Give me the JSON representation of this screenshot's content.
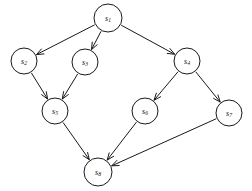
{
  "diagram": {
    "type": "directed-graph",
    "background_color": "#ffffff",
    "stroke_color": "#1a1a1a",
    "node_fill_color": "#ffffff",
    "nodes": [
      {
        "id": "s1",
        "label_base": "s",
        "label_sub": "1",
        "cx": 108,
        "cy": 18,
        "r": 14
      },
      {
        "id": "s2",
        "label_base": "s",
        "label_sub": "2",
        "cx": 24,
        "cy": 61,
        "r": 13
      },
      {
        "id": "s3",
        "label_base": "s",
        "label_sub": "3",
        "cx": 85,
        "cy": 62,
        "r": 13
      },
      {
        "id": "s4",
        "label_base": "s",
        "label_sub": "4",
        "cx": 187,
        "cy": 61,
        "r": 13
      },
      {
        "id": "s5",
        "label_base": "s",
        "label_sub": "5",
        "cx": 55,
        "cy": 111,
        "r": 13
      },
      {
        "id": "s6",
        "label_base": "s",
        "label_sub": "6",
        "cx": 145,
        "cy": 111,
        "r": 13
      },
      {
        "id": "s7",
        "label_base": "s",
        "label_sub": "7",
        "cx": 229,
        "cy": 113,
        "r": 13
      },
      {
        "id": "s8",
        "label_base": "s",
        "label_sub": "8",
        "cx": 98,
        "cy": 172,
        "r": 14
      }
    ],
    "edges": [
      {
        "id": "e1",
        "from": "s1",
        "to": "s2",
        "directed": true
      },
      {
        "id": "e2",
        "from": "s1",
        "to": "s3",
        "directed": true
      },
      {
        "id": "e3",
        "from": "s1",
        "to": "s4",
        "directed": true
      },
      {
        "id": "e4",
        "from": "s2",
        "to": "s5",
        "directed": true
      },
      {
        "id": "e5",
        "from": "s3",
        "to": "s5",
        "directed": true
      },
      {
        "id": "e6",
        "from": "s4",
        "to": "s6",
        "directed": true
      },
      {
        "id": "e7",
        "from": "s4",
        "to": "s7",
        "directed": true
      },
      {
        "id": "e8",
        "from": "s5",
        "to": "s8",
        "directed": true
      },
      {
        "id": "e9",
        "from": "s6",
        "to": "s8",
        "directed": true
      },
      {
        "id": "e10",
        "from": "s7",
        "to": "s8",
        "directed": true
      }
    ]
  }
}
